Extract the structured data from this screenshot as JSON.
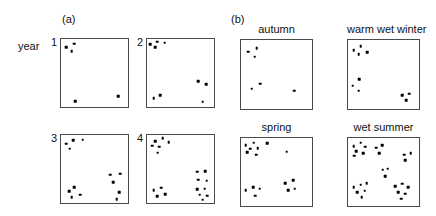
{
  "figure": {
    "groups": [
      {
        "label": "(a)",
        "x": 62,
        "y": 14
      },
      {
        "label": "(b)",
        "x": 231,
        "y": 14
      }
    ],
    "row_label": {
      "text": "year",
      "x": 18,
      "y": 41
    },
    "marker_color": "#000000",
    "box_border_color": "#4a4a4a",
    "panels": [
      {
        "name": "year-1",
        "index_label": "1",
        "title": "",
        "x": 60,
        "y": 38,
        "w": 69,
        "h": 70,
        "points": [
          [
            0.09,
            0.13
          ],
          [
            0.21,
            0.08
          ],
          [
            0.17,
            0.19
          ],
          [
            0.22,
            0.9
          ],
          [
            0.84,
            0.83
          ]
        ]
      },
      {
        "name": "year-2",
        "index_label": "2",
        "title": "",
        "x": 146,
        "y": 38,
        "w": 69,
        "h": 70,
        "points": [
          [
            0.06,
            0.09
          ],
          [
            0.16,
            0.05
          ],
          [
            0.13,
            0.13
          ],
          [
            0.27,
            0.07
          ],
          [
            0.76,
            0.62
          ],
          [
            0.87,
            0.66
          ],
          [
            0.11,
            0.86
          ],
          [
            0.21,
            0.82
          ],
          [
            0.82,
            0.91
          ]
        ]
      },
      {
        "name": "year-3",
        "index_label": "3",
        "title": "",
        "x": 60,
        "y": 134,
        "w": 69,
        "h": 70,
        "points": [
          [
            0.09,
            0.14
          ],
          [
            0.19,
            0.09
          ],
          [
            0.14,
            0.21
          ],
          [
            0.33,
            0.08
          ],
          [
            0.73,
            0.58
          ],
          [
            0.87,
            0.57
          ],
          [
            0.77,
            0.69
          ],
          [
            0.13,
            0.82
          ],
          [
            0.21,
            0.76
          ],
          [
            0.17,
            0.9
          ],
          [
            0.29,
            0.87
          ],
          [
            0.86,
            0.83
          ],
          [
            0.82,
            0.93
          ]
        ]
      },
      {
        "name": "year-4",
        "index_label": "4",
        "title": "",
        "x": 146,
        "y": 134,
        "w": 69,
        "h": 70,
        "points": [
          [
            0.13,
            0.1
          ],
          [
            0.24,
            0.06
          ],
          [
            0.33,
            0.12
          ],
          [
            0.09,
            0.17
          ],
          [
            0.19,
            0.18
          ],
          [
            0.17,
            0.27
          ],
          [
            0.74,
            0.54
          ],
          [
            0.86,
            0.53
          ],
          [
            0.76,
            0.65
          ],
          [
            0.88,
            0.67
          ],
          [
            0.11,
            0.8
          ],
          [
            0.22,
            0.77
          ],
          [
            0.16,
            0.89
          ],
          [
            0.28,
            0.86
          ],
          [
            0.74,
            0.79
          ],
          [
            0.85,
            0.78
          ],
          [
            0.78,
            0.87
          ],
          [
            0.89,
            0.88
          ],
          [
            0.82,
            0.94
          ]
        ]
      },
      {
        "name": "autumn",
        "index_label": "",
        "title": "autumn",
        "x": 240,
        "y": 39,
        "w": 73,
        "h": 71,
        "points": [
          [
            0.11,
            0.18
          ],
          [
            0.23,
            0.13
          ],
          [
            0.2,
            0.25
          ],
          [
            0.28,
            0.63
          ],
          [
            0.16,
            0.7
          ],
          [
            0.74,
            0.73
          ]
        ]
      },
      {
        "name": "warm-wet-winter",
        "index_label": "",
        "title": "warm wet winter",
        "x": 347,
        "y": 39,
        "w": 73,
        "h": 71,
        "points": [
          [
            0.09,
            0.16
          ],
          [
            0.19,
            0.1
          ],
          [
            0.16,
            0.21
          ],
          [
            0.28,
            0.19
          ],
          [
            0.17,
            0.57
          ],
          [
            0.08,
            0.66
          ],
          [
            0.16,
            0.73
          ],
          [
            0.76,
            0.79
          ],
          [
            0.85,
            0.77
          ],
          [
            0.81,
            0.86
          ]
        ]
      },
      {
        "name": "spring",
        "index_label": "",
        "title": "spring",
        "x": 240,
        "y": 137,
        "w": 73,
        "h": 70,
        "points": [
          [
            0.08,
            0.12
          ],
          [
            0.19,
            0.08
          ],
          [
            0.14,
            0.17
          ],
          [
            0.24,
            0.16
          ],
          [
            0.1,
            0.22
          ],
          [
            0.22,
            0.25
          ],
          [
            0.37,
            0.09
          ],
          [
            0.64,
            0.21
          ],
          [
            0.08,
            0.76
          ],
          [
            0.18,
            0.72
          ],
          [
            0.27,
            0.74
          ],
          [
            0.21,
            0.84
          ],
          [
            0.62,
            0.66
          ],
          [
            0.73,
            0.62
          ],
          [
            0.66,
            0.76
          ],
          [
            0.75,
            0.74
          ]
        ]
      },
      {
        "name": "wet-summer",
        "index_label": "",
        "title": "wet summer",
        "x": 347,
        "y": 137,
        "w": 73,
        "h": 70,
        "points": [
          [
            0.09,
            0.13
          ],
          [
            0.19,
            0.08
          ],
          [
            0.25,
            0.14
          ],
          [
            0.13,
            0.2
          ],
          [
            0.22,
            0.23
          ],
          [
            0.1,
            0.27
          ],
          [
            0.4,
            0.15
          ],
          [
            0.48,
            0.12
          ],
          [
            0.44,
            0.23
          ],
          [
            0.78,
            0.25
          ],
          [
            0.87,
            0.23
          ],
          [
            0.8,
            0.33
          ],
          [
            0.49,
            0.47
          ],
          [
            0.56,
            0.45
          ],
          [
            0.52,
            0.56
          ],
          [
            0.09,
            0.72
          ],
          [
            0.19,
            0.68
          ],
          [
            0.27,
            0.66
          ],
          [
            0.14,
            0.79
          ],
          [
            0.24,
            0.77
          ],
          [
            0.2,
            0.86
          ],
          [
            0.66,
            0.7
          ],
          [
            0.76,
            0.67
          ],
          [
            0.84,
            0.72
          ],
          [
            0.7,
            0.79
          ],
          [
            0.8,
            0.81
          ],
          [
            0.74,
            0.88
          ]
        ]
      }
    ]
  },
  "chart_data": {
    "type": "scatter",
    "title": "",
    "xlabel": "",
    "ylabel": "",
    "xlim": [
      0,
      1
    ],
    "ylim": [
      0,
      1
    ],
    "grid": false,
    "legend": "none",
    "panel_layout": "2 groups (a) and (b), each 2x2 small multiples",
    "annotations": [
      "(a)",
      "(b)",
      "year"
    ],
    "panels": [
      {
        "label": "1",
        "group": "(a)",
        "n_points": 5
      },
      {
        "label": "2",
        "group": "(a)",
        "n_points": 9
      },
      {
        "label": "3",
        "group": "(a)",
        "n_points": 13
      },
      {
        "label": "4",
        "group": "(a)",
        "n_points": 19
      },
      {
        "label": "autumn",
        "group": "(b)",
        "n_points": 6
      },
      {
        "label": "warm wet winter",
        "group": "(b)",
        "n_points": 10
      },
      {
        "label": "spring",
        "group": "(b)",
        "n_points": 16
      },
      {
        "label": "wet summer",
        "group": "(b)",
        "n_points": 27
      }
    ]
  }
}
